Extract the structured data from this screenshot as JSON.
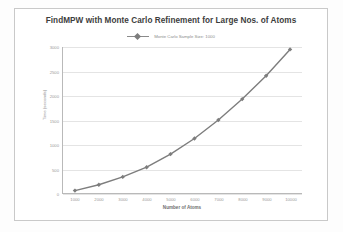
{
  "chart_data": {
    "type": "line",
    "title": "FindMPW with Monte Carlo Refinement for Large Nos. of Atoms",
    "xlabel": "Number of Atoms",
    "ylabel": "Time (seconds)",
    "grid": true,
    "legend_position": "top-center",
    "legend": [
      "Monte Carlo Sample Size: 1000"
    ],
    "categories": [
      "1000",
      "2000",
      "3000",
      "4000",
      "5000",
      "6000",
      "7000",
      "8000",
      "9000",
      "10000"
    ],
    "x": [
      1000,
      2000,
      3000,
      4000,
      5000,
      6000,
      7000,
      8000,
      9000,
      10000
    ],
    "ylim": [
      0,
      3000
    ],
    "yticks": [
      0,
      500,
      1000,
      1500,
      2000,
      2500,
      3000
    ],
    "ytick_labels": [
      "0",
      "500",
      "1000",
      "1500",
      "2000",
      "2500",
      "3000"
    ],
    "series": [
      {
        "name": "Monte Carlo Sample Size: 1000",
        "color": "#7d7d7d",
        "marker": "diamond",
        "values": [
          50,
          170,
          330,
          530,
          800,
          1120,
          1500,
          1930,
          2410,
          2950
        ]
      }
    ]
  },
  "legend_marker_name": "line-marker-icon"
}
